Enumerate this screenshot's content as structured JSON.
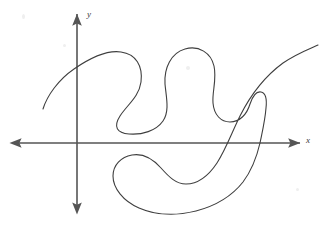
{
  "figure": {
    "kind": "hand-drawn-math-diagram",
    "caption_text": "",
    "background_color": "#ffffff",
    "stroke_color": "#3f3f3f",
    "axis_color": "#555555",
    "width": 330,
    "height": 247
  },
  "axes": {
    "x_axis": {
      "label": "x",
      "orientation": "horizontal",
      "y_position": 143,
      "x_start": 12,
      "x_end": 300,
      "arrow_left": true,
      "arrow_right": true,
      "label_style": "italic"
    },
    "y_axis": {
      "label": "y",
      "orientation": "vertical",
      "x_position": 77,
      "y_start": 14,
      "y_end": 212,
      "arrow_top": true,
      "arrow_bottom": true,
      "label_style": "italic"
    },
    "origin": {
      "x": 77,
      "y": 143
    }
  },
  "chart_data": {
    "type": "line",
    "title": "",
    "xlabel": "x",
    "ylabel": "y",
    "grid": false,
    "legend": null,
    "curves": [
      {
        "name": "main-squiggle",
        "closed": false,
        "stroke": "#3f3f3f",
        "stroke_width": 1.1,
        "path": "M 43 109 C 47 96 58 80 74 69 C 90 58 108 50 121 52 C 136 54 143 66 141 82 C 139 97 127 105 120 116 C 113 127 117 133 129 134 C 142 135 156 131 163 121 C 170 111 166 96 165 84 C 164 68 171 53 185 49 C 199 45 211 53 214 66 C 217 79 212 92 213 103 C 214 115 221 122 230 122 C 240 122 247 114 250 104 C 253 95 256 91 261 92 C 266 93 267 99 266 108 C 265 121 262 133 260 143 C 257 156 252 170 243 182 C 232 196 215 206 196 211 C 176 216 155 215 139 208 C 123 201 113 188 113 176 C 113 165 121 157 132 155 C 143 153 153 159 161 168 C 169 177 176 184 186 184 C 198 184 209 175 217 163 C 226 149 232 132 240 116 C 252 92 268 74 283 63 C 296 54 309 49 318 45"
      }
    ],
    "key_features": [
      {
        "name": "left-entry-endpoint",
        "x": 43,
        "y": 109
      },
      {
        "name": "first-peak-apex",
        "x": 120,
        "y": 52
      },
      {
        "name": "first-valley-lobe-bottom",
        "x": 130,
        "y": 133
      },
      {
        "name": "second-peak-apex",
        "x": 188,
        "y": 49
      },
      {
        "name": "right-notch-dip",
        "x": 232,
        "y": 122
      },
      {
        "name": "right-notch-peak",
        "x": 261,
        "y": 92
      },
      {
        "name": "bottom-hook-left-tip",
        "x": 113,
        "y": 176
      },
      {
        "name": "bottom-lobe-lowest",
        "x": 190,
        "y": 212
      },
      {
        "name": "right-exit-endpoint",
        "x": 318,
        "y": 45
      }
    ]
  },
  "annotations": []
}
